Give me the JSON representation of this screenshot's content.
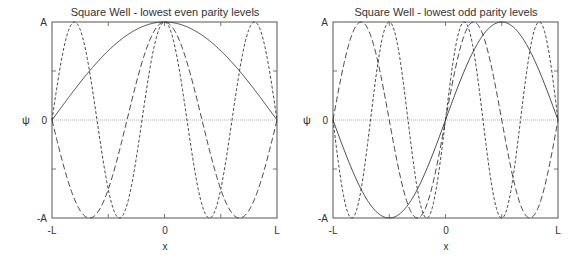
{
  "chart_data": [
    {
      "type": "line",
      "title": "Square Well - lowest even parity levels",
      "xlabel": "x",
      "ylabel": "ψ",
      "xticks": [
        "-L",
        "0",
        "L"
      ],
      "yticks": [
        "A",
        "0",
        "-A"
      ],
      "xlim": [
        -1,
        1
      ],
      "ylim": [
        -1,
        1
      ],
      "zero_line": true,
      "series": [
        {
          "name": "n=1",
          "style": "solid",
          "function": "A cos(πx/2L)",
          "k": 1
        },
        {
          "name": "n=3",
          "style": "long-dash",
          "function": "A cos(3πx/2L)",
          "k": 3
        },
        {
          "name": "n=5",
          "style": "short-dash",
          "function": "A cos(5πx/2L)",
          "k": 5
        }
      ]
    },
    {
      "type": "line",
      "title": "Square Well - lowest odd parity levels",
      "xlabel": "x",
      "ylabel": "ψ",
      "xticks": [
        "-L",
        "0",
        "L"
      ],
      "yticks": [
        "A",
        "0",
        "-A"
      ],
      "xlim": [
        -1,
        1
      ],
      "ylim": [
        -1,
        1
      ],
      "zero_line": true,
      "series": [
        {
          "name": "n=2",
          "style": "solid",
          "function": "A sin(πx/L)",
          "k": 2
        },
        {
          "name": "n=4",
          "style": "long-dash",
          "function": "A sin(2πx/L)",
          "k": 4
        },
        {
          "name": "n=6",
          "style": "short-dash",
          "function": "A sin(3πx/L)",
          "k": 6
        }
      ]
    }
  ],
  "panels": [
    {
      "title": "Square Well - lowest even parity levels",
      "ylabel": "ψ",
      "xlabel": "x",
      "ytick_top": "A",
      "ytick_mid": "0",
      "ytick_bot": "-A",
      "xtick_left": "-L",
      "xtick_mid": "0",
      "xtick_right": "L"
    },
    {
      "title": "Square Well - lowest odd parity levels",
      "ylabel": "ψ",
      "xlabel": "x",
      "ytick_top": "A",
      "ytick_mid": "0",
      "ytick_bot": "-A",
      "xtick_left": "-L",
      "xtick_mid": "0",
      "xtick_right": "L"
    }
  ],
  "colors": {
    "axis": "#555555",
    "curve": "#333333",
    "zero": "#999999"
  }
}
